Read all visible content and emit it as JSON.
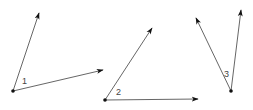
{
  "diagram": {
    "type": "angles",
    "stroke_color": "#555555",
    "vertex_color": "#111111",
    "angles": [
      {
        "label": "1",
        "vertex": [
          13,
          91
        ],
        "ray_a": [
          39,
          13
        ],
        "ray_b": [
          103,
          70
        ],
        "label_pos": [
          22,
          84
        ]
      },
      {
        "label": "2",
        "vertex": [
          105,
          100
        ],
        "ray_a": [
          152,
          28
        ],
        "ray_b": [
          198,
          99
        ],
        "label_pos": [
          116,
          95
        ]
      },
      {
        "label": "3",
        "vertex": [
          231,
          91
        ],
        "ray_a": [
          196,
          18
        ],
        "ray_b": [
          241,
          10
        ],
        "label_pos": [
          224,
          77
        ]
      }
    ]
  }
}
